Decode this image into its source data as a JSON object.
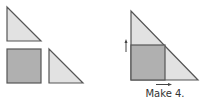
{
  "colors": {
    "light_fill": "#e2e2e2",
    "dark_fill": "#b0b0b0",
    "stroke": "#555555",
    "arrow": "#444444"
  },
  "pieces": [
    {
      "name": "small-triangle-top",
      "shape": "right-triangle"
    },
    {
      "name": "square",
      "shape": "square"
    },
    {
      "name": "small-triangle-right",
      "shape": "right-triangle"
    }
  ],
  "assembled": {
    "shape": "large-right-triangle",
    "contains": [
      "square",
      "two small triangles"
    ],
    "arrows": [
      "up",
      "right"
    ]
  },
  "caption": "Make 4."
}
